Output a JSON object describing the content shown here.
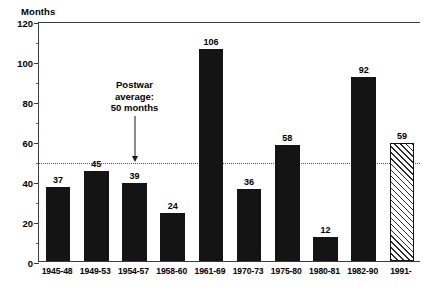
{
  "chart_data": {
    "type": "bar",
    "title": "",
    "subtitle": "",
    "xlabel": "",
    "ylabel": "Months",
    "ylim": [
      0,
      120
    ],
    "yticks": [
      0,
      20,
      40,
      60,
      80,
      100,
      120
    ],
    "ytick_labels": [
      "0",
      "20",
      "40",
      "60",
      "80",
      "100",
      "120"
    ],
    "minor_tick_step": 10,
    "grid": false,
    "legend": "none",
    "categories": [
      "1945-48",
      "1949-53",
      "1954-57",
      "1958-60",
      "1961-69",
      "1970-73",
      "1975-80",
      "1980-81",
      "1982-90",
      "1991-"
    ],
    "values": [
      37,
      45,
      39,
      24,
      106,
      36,
      58,
      12,
      92,
      59
    ],
    "value_labels": [
      "37",
      "45",
      "39",
      "24",
      "106",
      "36",
      "58",
      "12",
      "92",
      "59"
    ],
    "bar_styles": [
      "solid",
      "solid",
      "solid",
      "solid",
      "solid",
      "solid",
      "solid",
      "solid",
      "solid",
      "hatched"
    ],
    "reference_line": {
      "value": 50,
      "style": "dotted",
      "label_lines": [
        "Postwar",
        "average:",
        "50 months"
      ]
    },
    "colors": {
      "bar_solid": "#141414",
      "bar_hatch_line": "#2b2b2b",
      "axis": "#3a3a3a",
      "reference_line": "#555555",
      "text": "#000000",
      "background": "#ffffff"
    }
  }
}
